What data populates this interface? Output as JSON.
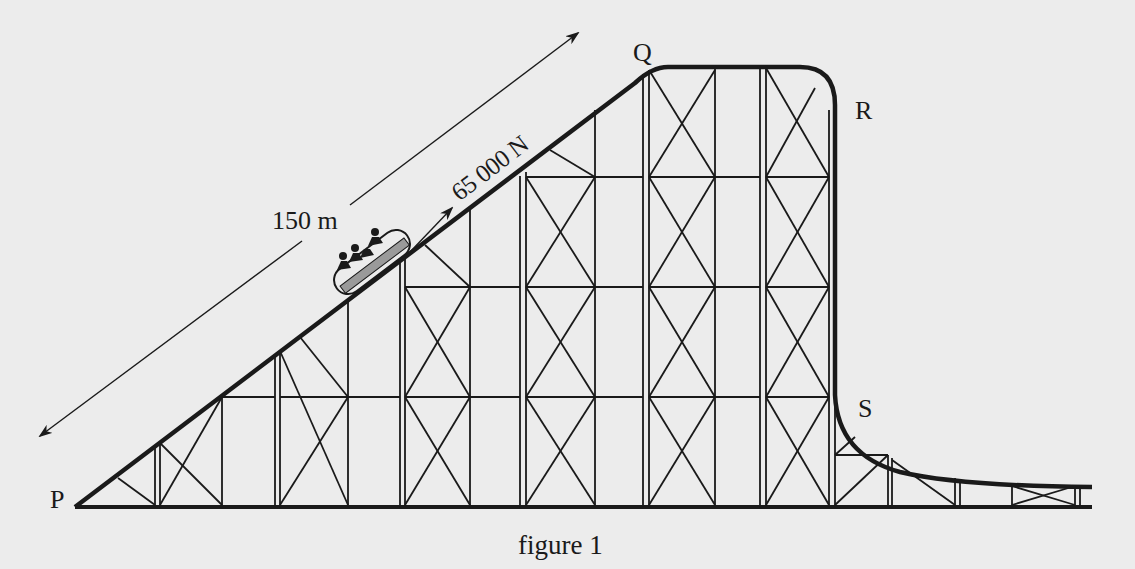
{
  "figure": {
    "caption": "figure 1",
    "points": {
      "P": "P",
      "Q": "Q",
      "R": "R",
      "S": "S"
    },
    "distance_label": "150 m",
    "force_label": "65 000 N",
    "colors": {
      "background": "#ececec",
      "ink": "#1a1a1a",
      "car_stripe": "#9a9a9a"
    }
  }
}
